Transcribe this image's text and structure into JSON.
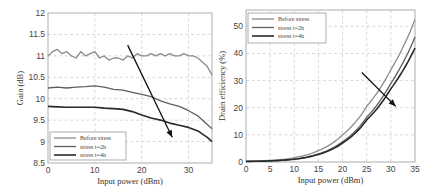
{
  "chart_data": [
    {
      "type": "line",
      "title": "",
      "xlabel": "Input power (dBm)",
      "ylabel": "Gain (dB)",
      "xlim": [
        0,
        35
      ],
      "ylim": [
        8.5,
        12
      ],
      "xticks": [
        "0",
        "10",
        "20",
        "30"
      ],
      "yticks": [
        "8.5",
        "9",
        "9.5",
        "10",
        "10.5",
        "11",
        "11.5",
        "12"
      ],
      "grid": true,
      "legend_position": "lower left",
      "annotation": "arrow pointing down-right indicating degradation with stress time",
      "series": [
        {
          "name": "Before stress",
          "color": "#8c8c8c",
          "x": [
            0,
            1,
            2,
            3,
            4,
            5,
            6,
            7,
            8,
            9,
            10,
            11,
            12,
            13,
            14,
            15,
            16,
            17,
            18,
            19,
            20,
            21,
            22,
            23,
            24,
            25,
            26,
            27,
            28,
            29,
            30,
            31,
            32,
            33,
            34,
            35
          ],
          "values": [
            11.0,
            11.1,
            11.15,
            11.05,
            11.1,
            11.0,
            10.95,
            11.1,
            11.0,
            11.05,
            11.1,
            10.95,
            11.0,
            10.9,
            10.95,
            10.95,
            10.9,
            11.0,
            10.95,
            11.05,
            11.0,
            11.0,
            11.05,
            11.0,
            11.05,
            11.0,
            11.05,
            11.0,
            11.0,
            11.05,
            11.0,
            11.0,
            10.95,
            10.85,
            10.75,
            10.55
          ]
        },
        {
          "name": "stress t=2h",
          "color": "#5f5f5f",
          "x": [
            0,
            2,
            4,
            6,
            8,
            10,
            12,
            14,
            16,
            18,
            20,
            22,
            24,
            26,
            28,
            30,
            32,
            34,
            35
          ],
          "values": [
            10.25,
            10.27,
            10.25,
            10.27,
            10.28,
            10.3,
            10.27,
            10.22,
            10.2,
            10.15,
            10.1,
            10.05,
            9.95,
            9.88,
            9.82,
            9.72,
            9.6,
            9.4,
            9.3
          ]
        },
        {
          "name": "stress t=4h",
          "color": "#2a2a2a",
          "x": [
            0,
            2,
            4,
            6,
            8,
            10,
            12,
            14,
            16,
            18,
            20,
            22,
            24,
            26,
            28,
            30,
            32,
            34,
            35
          ],
          "values": [
            9.82,
            9.81,
            9.8,
            9.8,
            9.8,
            9.8,
            9.78,
            9.77,
            9.75,
            9.7,
            9.62,
            9.55,
            9.5,
            9.43,
            9.38,
            9.33,
            9.25,
            9.1,
            9.0
          ]
        }
      ]
    },
    {
      "type": "line",
      "title": "",
      "xlabel": "Input power (dBm)",
      "ylabel": "Drain efficiency (%)",
      "xlim": [
        0,
        35
      ],
      "ylim": [
        0,
        56
      ],
      "xticks": [
        "0",
        "5",
        "10",
        "15",
        "20",
        "25",
        "30",
        "35"
      ],
      "yticks": [
        "0",
        "10",
        "20",
        "30",
        "40",
        "50"
      ],
      "grid": true,
      "legend_position": "upper left",
      "annotation": "arrow pointing down-right indicating degradation with stress time",
      "series": [
        {
          "name": "Before stress",
          "color": "#8c8c8c",
          "x": [
            0,
            5,
            10,
            15,
            20,
            25,
            30,
            35
          ],
          "values": [
            0.3,
            0.6,
            1.6,
            4.2,
            10.0,
            20.5,
            34.0,
            52.5
          ]
        },
        {
          "name": "stress t=2h",
          "color": "#5f5f5f",
          "x": [
            0,
            5,
            10,
            15,
            20,
            25,
            30,
            35
          ],
          "values": [
            0.2,
            0.4,
            1.1,
            3.0,
            7.5,
            16.5,
            29.0,
            46.0
          ]
        },
        {
          "name": "stress t=4h",
          "color": "#2a2a2a",
          "x": [
            0,
            5,
            10,
            15,
            20,
            25,
            30,
            35
          ],
          "values": [
            0.2,
            0.4,
            1.0,
            2.8,
            7.0,
            15.5,
            27.0,
            42.0
          ]
        }
      ]
    }
  ]
}
